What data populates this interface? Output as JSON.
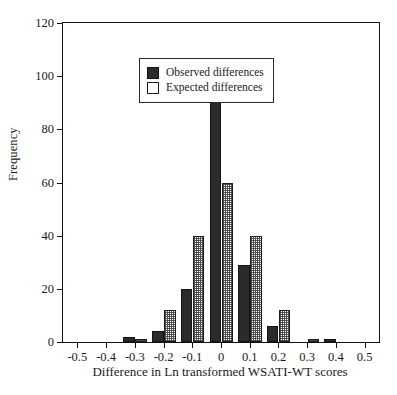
{
  "chart_data": {
    "type": "bar",
    "title": "",
    "xlabel": "Difference in Ln transformed WSATI-WT scores",
    "ylabel": "Frequency",
    "categories": [
      "-0.5",
      "-0.4",
      "-0.3",
      "-0.2",
      "-0.1",
      "0",
      "0.1",
      "0.2",
      "0.3",
      "0.4",
      "0.5"
    ],
    "x": [
      -0.5,
      -0.4,
      -0.3,
      -0.2,
      -0.1,
      0,
      0.1,
      0.2,
      0.3,
      0.4,
      0.5
    ],
    "series": [
      {
        "name": "Observed differences",
        "color": "#2b2b2b",
        "values": [
          0,
          0,
          2,
          4,
          20,
          104,
          29,
          6,
          0,
          1,
          0
        ]
      },
      {
        "name": "Expected differences",
        "color": "#ffffff",
        "values": [
          0,
          0,
          1,
          12,
          40,
          60,
          40,
          12,
          1,
          0,
          0
        ]
      }
    ],
    "xlim": [
      -0.55,
      0.55
    ],
    "ylim": [
      0,
      120
    ],
    "yticks": [
      0,
      20,
      40,
      60,
      80,
      100,
      120
    ],
    "ytick_labels": [
      "0",
      "20",
      "40",
      "60",
      "80",
      "100",
      "120"
    ],
    "xticks": [
      -0.5,
      -0.4,
      -0.3,
      -0.2,
      -0.1,
      0,
      0.1,
      0.2,
      0.3,
      0.4,
      0.5
    ],
    "xtick_labels": [
      "-0.5",
      "-0.4",
      "-0.3",
      "-0.2",
      "-0.1",
      "0",
      "0.1",
      "0.2",
      "0.3",
      "0.4",
      "0.5"
    ],
    "grid": false,
    "legend_position": "upper-left"
  },
  "axes": {
    "y_title": "Frequency",
    "x_title": "Difference in Ln transformed WSATI-WT scores"
  },
  "legend": {
    "entries": [
      {
        "label": "Observed differences",
        "style": "solid-dark"
      },
      {
        "label": "Expected differences",
        "style": "open-light"
      }
    ]
  }
}
